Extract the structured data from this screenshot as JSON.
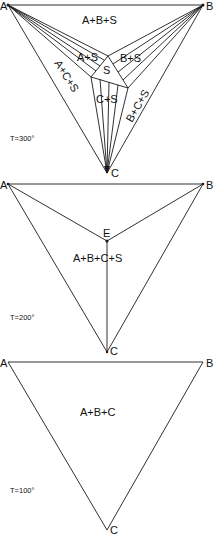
{
  "figure": {
    "stroke_color": "#1a1a1a",
    "panels": [
      {
        "id": "t300",
        "temperature_label": "T=300°",
        "vertices": {
          "a": "A",
          "b": "B",
          "c": "C"
        },
        "inner_vertex": "S",
        "regions": {
          "abs": "A+B+S",
          "as": "A+S",
          "bs": "B+S",
          "s": "S",
          "acs": "A+C+S",
          "cs": "C+S",
          "bcs": "B+C+S"
        }
      },
      {
        "id": "t200",
        "temperature_label": "T=200°",
        "vertices": {
          "a": "A",
          "b": "B",
          "c": "C"
        },
        "eutectic_point": "E",
        "regions": {
          "abcs": "A+B+C+S"
        }
      },
      {
        "id": "t100",
        "temperature_label": "T=100°",
        "vertices": {
          "a": "A",
          "b": "B",
          "c": "C"
        },
        "regions": {
          "abc": "A+B+C"
        }
      }
    ]
  }
}
